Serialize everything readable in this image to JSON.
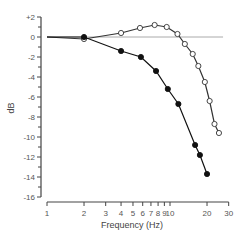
{
  "chart_data": {
    "type": "line",
    "title": "",
    "xlabel": "Frequency (Hz)",
    "ylabel": "dB",
    "xscale": "log",
    "xlim": [
      1,
      30
    ],
    "ylim": [
      -16,
      2
    ],
    "x_ticks": [
      1,
      2,
      3,
      4,
      5,
      6,
      7,
      8,
      9,
      10,
      20,
      30
    ],
    "x_tick_labels": [
      "1",
      "2",
      "3",
      "4",
      "5",
      "6",
      "7",
      "8",
      "9",
      "10",
      "20",
      "30"
    ],
    "y_ticks": [
      2,
      0,
      -2,
      -4,
      -6,
      -8,
      -10,
      -12,
      -14,
      -16
    ],
    "y_tick_labels": [
      "+2",
      "0",
      "-2",
      "-4",
      "-6",
      "-8",
      "-10",
      "-12",
      "-14",
      "-16"
    ],
    "y_minor_step": 1,
    "grid": false,
    "legend": null,
    "reference_line": {
      "y": 0,
      "x_from": 1,
      "x_to": 27,
      "color": "#aaaaaa"
    },
    "series": [
      {
        "name": "open-circles",
        "marker": "open-circle",
        "color": "#333333",
        "x": [
          1,
          2,
          4,
          5.7,
          7.5,
          9.4,
          11.5,
          13.2,
          15.3,
          17,
          19.2,
          21,
          23,
          25
        ],
        "y": [
          0,
          -0.2,
          0.4,
          0.9,
          1.2,
          1.0,
          0.3,
          -0.7,
          -1.7,
          -2.9,
          -4.5,
          -6.4,
          -8.7,
          -9.6
        ]
      },
      {
        "name": "filled-circles",
        "marker": "filled-circle",
        "color": "#111111",
        "x": [
          1,
          2,
          4,
          5.8,
          7.7,
          9.6,
          11.7,
          16,
          17.5,
          20
        ],
        "y": [
          0,
          0,
          -1.4,
          -2.0,
          -3.4,
          -5.2,
          -6.7,
          -10.8,
          -11.8,
          -13.7
        ]
      }
    ]
  }
}
